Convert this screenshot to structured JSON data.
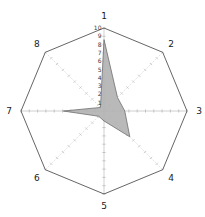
{
  "chart_data": {
    "type": "radar",
    "title": "",
    "axes": [
      "1",
      "2",
      "3",
      "4",
      "5",
      "6",
      "7",
      "8"
    ],
    "series": [
      {
        "name": "series-1",
        "values": [
          8.6,
          2.3,
          2.5,
          4.4,
          1.2,
          0.9,
          4.9,
          0.6
        ]
      }
    ],
    "radial_ticks": [
      1,
      2,
      3,
      4,
      5,
      6,
      7,
      8,
      9,
      10
    ],
    "radial_max": 10,
    "radial_tick_label_axis": "1",
    "axis_order": "clockwise-from-top",
    "legend_position": "none",
    "grid": "octagon-outline-with-unit-ticks",
    "colors": {
      "background": "#ffffff",
      "outline": "#3d3d3d",
      "axis_line": "#b0b0b0",
      "tick_mark": "#a8a8a8",
      "fill": "#b3b3b3",
      "fill_opacity": 0.92,
      "polygon_edge": "#6e6e6e",
      "radial_tick_label": "#3a3a3a",
      "axis_label": "#1a1a1a"
    }
  }
}
